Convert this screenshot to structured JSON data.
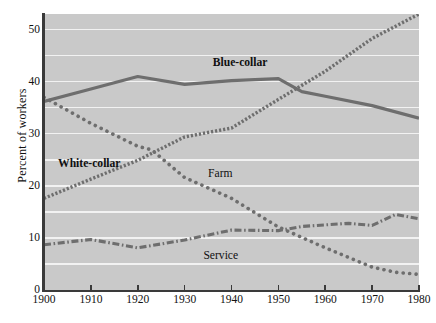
{
  "chart_data": {
    "type": "line",
    "title": "",
    "subtitle": "",
    "xlabel": "",
    "ylabel": "Percent of workers",
    "xlim": [
      1900,
      1980
    ],
    "ylim": [
      0,
      53
    ],
    "grid": "horizontal white gridlines every 5 units",
    "legend_position": "inline labels on plot",
    "x_ticks": [
      1900,
      1910,
      1920,
      1930,
      1940,
      1950,
      1960,
      1970,
      1980
    ],
    "y_ticks": [
      0,
      10,
      20,
      30,
      40,
      50
    ],
    "plot_background": "#c9c9c9",
    "gridline_color": "#f2f2f2",
    "line_color": "#6e6e6e",
    "series": [
      {
        "name": "Blue-collar",
        "style": "solid",
        "label_x": 1936,
        "label_y": 43.6,
        "x": [
          1900,
          1910,
          1920,
          1930,
          1940,
          1950,
          1955,
          1960,
          1970,
          1980
        ],
        "values": [
          36.2,
          38.6,
          41.0,
          39.5,
          40.2,
          40.6,
          38.1,
          37.2,
          35.4,
          33.0
        ]
      },
      {
        "name": "White-collar",
        "style": "fine-dotted",
        "label_x": 1903,
        "label_y": 24.2,
        "x": [
          1900,
          1910,
          1920,
          1930,
          1940,
          1950,
          1960,
          1970,
          1980
        ],
        "values": [
          17.6,
          21.3,
          24.9,
          29.4,
          31.1,
          36.6,
          42.0,
          48.3,
          53.0
        ]
      },
      {
        "name": "Farm",
        "style": "dotted",
        "label_x": 1935,
        "label_y": 22.2,
        "x": [
          1900,
          1910,
          1920,
          1923,
          1930,
          1940,
          1950,
          1960,
          1970,
          1975,
          1980
        ],
        "values": [
          37.0,
          32.0,
          27.6,
          26.9,
          21.6,
          17.6,
          12.1,
          8.1,
          4.4,
          3.4,
          3.0
        ]
      },
      {
        "name": "Service",
        "style": "dash-dot",
        "label_x": 1934,
        "label_y": 6.6,
        "x": [
          1900,
          1910,
          1920,
          1930,
          1940,
          1950,
          1955,
          1965,
          1970,
          1975,
          1980
        ],
        "values": [
          8.7,
          9.7,
          8.1,
          9.6,
          11.5,
          11.4,
          12.2,
          12.8,
          12.4,
          14.5,
          13.7
        ]
      }
    ]
  }
}
